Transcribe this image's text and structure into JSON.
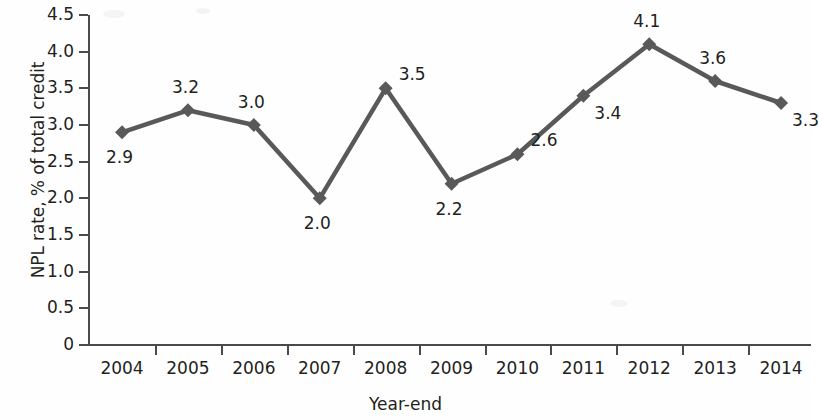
{
  "chart_data": {
    "type": "line",
    "title": "",
    "xlabel": "Year-end",
    "ylabel": "NPL rate, % of total credit",
    "categories": [
      "2004",
      "2005",
      "2006",
      "2007",
      "2008",
      "2009",
      "2010",
      "2011",
      "2012",
      "2013",
      "2014"
    ],
    "values": [
      2.9,
      3.2,
      3.0,
      2.0,
      3.5,
      2.2,
      2.6,
      3.4,
      4.1,
      3.6,
      3.3
    ],
    "point_labels": [
      "2.9",
      "3.2",
      "3.0",
      "2.0",
      "3.5",
      "2.2",
      "2.6",
      "3.4",
      "4.1",
      "3.6",
      "3.3"
    ],
    "label_positions": [
      "below",
      "above",
      "above",
      "below",
      "right",
      "below",
      "right",
      "below-right",
      "above",
      "above",
      "below-right"
    ],
    "ylim": [
      0,
      4.5
    ],
    "y_ticks": [
      0,
      0.5,
      1.0,
      1.5,
      2.0,
      2.5,
      3.0,
      3.5,
      4.0,
      4.5
    ],
    "y_tick_labels": [
      "0",
      "0.5",
      "1.0",
      "1.5",
      "2.0",
      "2.5",
      "3.0",
      "3.5",
      "4.0",
      "4.5"
    ],
    "grid": false,
    "legend": false,
    "marker": "diamond",
    "series_color": "#595959",
    "axis_color": "#4a4a4a",
    "text_color": "#231f20"
  }
}
